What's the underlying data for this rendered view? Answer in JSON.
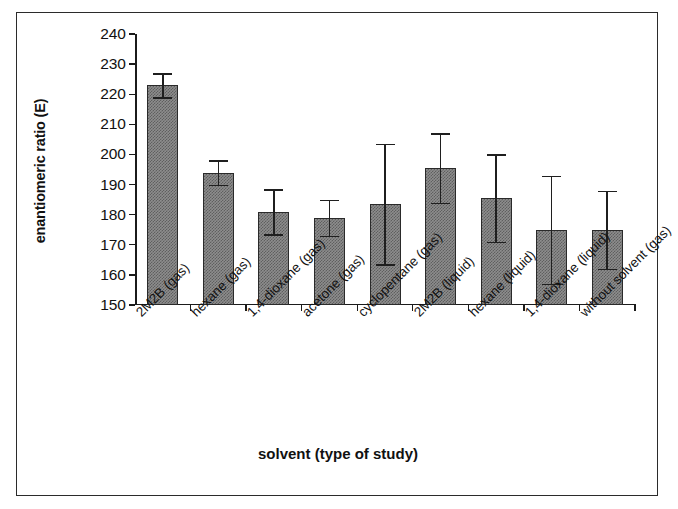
{
  "chart_data": {
    "type": "bar",
    "title": "",
    "xlabel": "solvent (type of study)",
    "ylabel": "enantiomeric ratio (E)",
    "ylim": [
      150,
      240
    ],
    "ytick_step": 10,
    "yticks": [
      150,
      160,
      170,
      180,
      190,
      200,
      210,
      220,
      230,
      240
    ],
    "grid": false,
    "legend": null,
    "bar_color": "#8d8d8d",
    "bar_edge_color": "#2a2a2a",
    "categories": [
      "2M2B (gas)",
      "hexane (gas)",
      "1,4-dioxane (gas)",
      "acetone (gas)",
      "cyclopentane (gas)",
      "2M2B (liquid)",
      "hexane (liquid)",
      "1,4-dioxane (liquid)",
      "without solvent (gas)"
    ],
    "values": [
      223,
      194,
      181,
      179,
      183.5,
      195.5,
      185.5,
      175,
      175
    ],
    "errors": [
      4,
      4,
      7.5,
      6,
      20,
      11.5,
      14.5,
      18,
      13
    ]
  }
}
